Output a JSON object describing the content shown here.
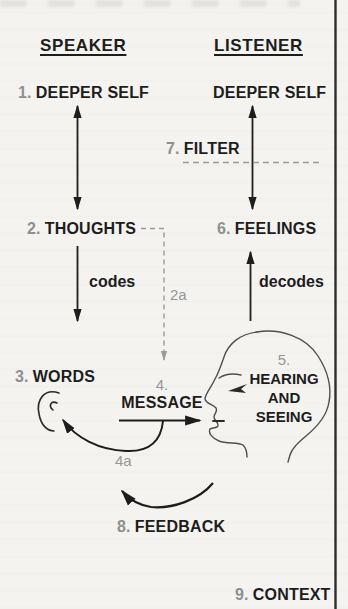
{
  "headers": {
    "speaker": "SPEAKER",
    "listener": "LISTENER"
  },
  "nodes": {
    "deeper_self_speaker": {
      "num": "1.",
      "label": "DEEPER SELF"
    },
    "deeper_self_listener": {
      "label": "DEEPER SELF"
    },
    "filter": {
      "num": "7.",
      "label": "FILTER"
    },
    "thoughts": {
      "num": "2.",
      "label": "THOUGHTS"
    },
    "feelings": {
      "num": "6.",
      "label": "FEELINGS"
    },
    "words": {
      "num": "3.",
      "label": "WORDS"
    },
    "message": {
      "num": "4.",
      "label": "MESSAGE"
    },
    "hearing_seeing": {
      "num": "5.",
      "lines": [
        "HEARING",
        "AND",
        "SEEING"
      ]
    },
    "feedback": {
      "num": "8.",
      "label": "FEEDBACK"
    },
    "context": {
      "num": "9.",
      "label": "CONTEXT"
    }
  },
  "edge_labels": {
    "codes": "codes",
    "decodes": "decodes",
    "thoughts_alt": "2a",
    "words_alt": "4a"
  },
  "icons": {
    "listener_head": "head-profile-icon",
    "speaker_ear": "ear-icon",
    "listener_eye": "eye-arrow-icon"
  },
  "colors": {
    "ink": "#1d1d1d",
    "muted_number": "#8f8f8f",
    "dashed_line": "#9a9a9a",
    "sketch_outline": "#4f4f4f",
    "background": "#f4f3f0",
    "page_border": "#2d2d2d"
  }
}
